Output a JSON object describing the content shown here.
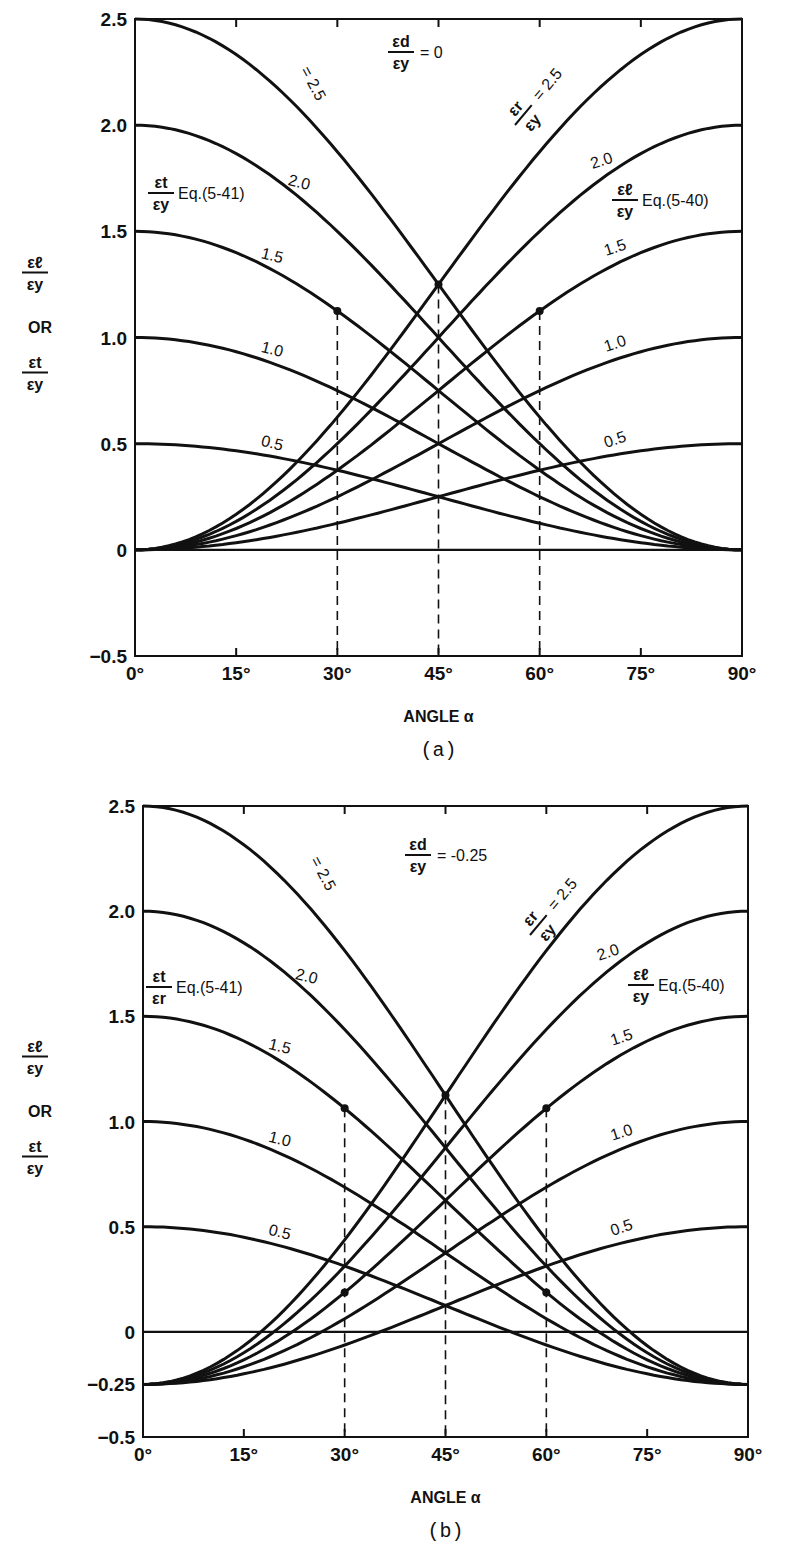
{
  "chart_data": [
    {
      "panel": "a",
      "type": "line",
      "caption": "(a)",
      "xlabel": "ANGLE α",
      "ylabel": [
        "εℓ/εy",
        "OR",
        "εt/εy"
      ],
      "x_ticks": [
        "0°",
        "15°",
        "30°",
        "45°",
        "60°",
        "75°",
        "90°"
      ],
      "y_ticks": [
        "2.5",
        "2.0",
        "1.5",
        "1.0",
        "0.5",
        "0",
        "-0.5"
      ],
      "xlim": [
        0,
        90
      ],
      "ylim": [
        -0.5,
        2.5
      ],
      "eps_d_over_eps_y": 0,
      "parameter_label": "εd/εy = 0",
      "curve_family_label": "εr/εy = 2.5",
      "eps_r_values": [
        0.5,
        1.0,
        1.5,
        2.0,
        2.5
      ],
      "curve_labels": [
        "0.5",
        "1.0",
        "1.5",
        "2.0"
      ],
      "eq_labels": {
        "et": "εt/εy Eq.(5-41)",
        "el": "εℓ/εy Eq.(5-40)"
      },
      "dashed_verticals": [
        30,
        45,
        60
      ],
      "marked_points": [
        {
          "x": 30,
          "y": 1.125
        },
        {
          "x": 60,
          "y": 1.125
        },
        {
          "x": 45,
          "y": 1.25
        }
      ],
      "series": [
        {
          "name": "εℓ/εy, εr/εy=0.5",
          "x": [
            0,
            15,
            30,
            45,
            60,
            75,
            90
          ],
          "values": [
            0,
            0.033,
            0.125,
            0.25,
            0.375,
            0.467,
            0.5
          ]
        },
        {
          "name": "εℓ/εy, εr/εy=1.0",
          "x": [
            0,
            15,
            30,
            45,
            60,
            75,
            90
          ],
          "values": [
            0,
            0.067,
            0.25,
            0.5,
            0.75,
            0.933,
            1.0
          ]
        },
        {
          "name": "εℓ/εy, εr/εy=1.5",
          "x": [
            0,
            15,
            30,
            45,
            60,
            75,
            90
          ],
          "values": [
            0,
            0.1,
            0.375,
            0.75,
            1.125,
            1.4,
            1.5
          ]
        },
        {
          "name": "εℓ/εy, εr/εy=2.0",
          "x": [
            0,
            15,
            30,
            45,
            60,
            75,
            90
          ],
          "values": [
            0,
            0.134,
            0.5,
            1.0,
            1.5,
            1.866,
            2.0
          ]
        },
        {
          "name": "εℓ/εy, εr/εy=2.5",
          "x": [
            0,
            15,
            30,
            45,
            60,
            75,
            90
          ],
          "values": [
            0,
            0.167,
            0.625,
            1.25,
            1.875,
            2.333,
            2.5
          ]
        },
        {
          "name": "εt/εy, εr/εy=0.5",
          "x": [
            0,
            15,
            30,
            45,
            60,
            75,
            90
          ],
          "values": [
            0.5,
            0.467,
            0.375,
            0.25,
            0.125,
            0.033,
            0
          ]
        },
        {
          "name": "εt/εy, εr/εy=1.0",
          "x": [
            0,
            15,
            30,
            45,
            60,
            75,
            90
          ],
          "values": [
            1.0,
            0.933,
            0.75,
            0.5,
            0.25,
            0.067,
            0
          ]
        },
        {
          "name": "εt/εy, εr/εy=1.5",
          "x": [
            0,
            15,
            30,
            45,
            60,
            75,
            90
          ],
          "values": [
            1.5,
            1.4,
            1.125,
            0.75,
            0.375,
            0.1,
            0
          ]
        },
        {
          "name": "εt/εy, εr/εy=2.0",
          "x": [
            0,
            15,
            30,
            45,
            60,
            75,
            90
          ],
          "values": [
            2.0,
            1.866,
            1.5,
            1.0,
            0.5,
            0.134,
            0
          ]
        },
        {
          "name": "εt/εy, εr/εy=2.5",
          "x": [
            0,
            15,
            30,
            45,
            60,
            75,
            90
          ],
          "values": [
            2.5,
            2.333,
            1.875,
            1.25,
            0.625,
            0.167,
            0
          ]
        }
      ],
      "grid": false,
      "legend": "inline labels"
    },
    {
      "panel": "b",
      "type": "line",
      "caption": "(b)",
      "xlabel": "ANGLE α",
      "ylabel": [
        "εℓ/εy",
        "OR",
        "εt/εy"
      ],
      "x_ticks": [
        "0°",
        "15°",
        "30°",
        "45°",
        "60°",
        "75°",
        "90°"
      ],
      "y_ticks": [
        "2.5",
        "2.0",
        "1.5",
        "1.0",
        "0.5",
        "0",
        "-0.25",
        "-0.5"
      ],
      "xlim": [
        0,
        90
      ],
      "ylim": [
        -0.5,
        2.5
      ],
      "eps_d_over_eps_y": -0.25,
      "parameter_label": "εd/εy = -0.25",
      "curve_family_label": "εr/εy = 2.5",
      "eps_r_values": [
        0.5,
        1.0,
        1.5,
        2.0,
        2.5
      ],
      "curve_labels": [
        "0.5",
        "1.0",
        "1.5",
        "2.0"
      ],
      "eq_labels": {
        "et": "εt/εr Eq.(5-41)",
        "el": "εℓ/εy Eq.(5-40)"
      },
      "dashed_verticals": [
        30,
        45,
        60
      ],
      "marked_points": [
        {
          "x": 30,
          "y": 1.0625
        },
        {
          "x": 60,
          "y": 1.0625
        },
        {
          "x": 30,
          "y": 0.1875
        },
        {
          "x": 60,
          "y": 0.1875
        },
        {
          "x": 45,
          "y": 1.125
        }
      ],
      "series": [
        {
          "name": "εℓ/εy, εr/εy=0.5",
          "x": [
            0,
            15,
            30,
            45,
            60,
            75,
            90
          ],
          "values": [
            -0.25,
            -0.2,
            -0.063,
            0.125,
            0.313,
            0.45,
            0.5
          ]
        },
        {
          "name": "εℓ/εy, εr/εy=1.0",
          "x": [
            0,
            15,
            30,
            45,
            60,
            75,
            90
          ],
          "values": [
            -0.25,
            -0.166,
            0.063,
            0.375,
            0.688,
            0.916,
            1.0
          ]
        },
        {
          "name": "εℓ/εy, εr/εy=1.5",
          "x": [
            0,
            15,
            30,
            45,
            60,
            75,
            90
          ],
          "values": [
            -0.25,
            -0.133,
            0.188,
            0.625,
            1.063,
            1.383,
            1.5
          ]
        },
        {
          "name": "εℓ/εy, εr/εy=2.0",
          "x": [
            0,
            15,
            30,
            45,
            60,
            75,
            90
          ],
          "values": [
            -0.25,
            -0.099,
            0.313,
            0.875,
            1.438,
            1.849,
            2.0
          ]
        },
        {
          "name": "εℓ/εy, εr/εy=2.5",
          "x": [
            0,
            15,
            30,
            45,
            60,
            75,
            90
          ],
          "values": [
            -0.25,
            -0.066,
            0.438,
            1.125,
            1.813,
            2.316,
            2.5
          ]
        },
        {
          "name": "εt/εy, εr/εy=0.5",
          "x": [
            0,
            15,
            30,
            45,
            60,
            75,
            90
          ],
          "values": [
            0.5,
            0.45,
            0.313,
            0.125,
            -0.063,
            -0.2,
            -0.25
          ]
        },
        {
          "name": "εt/εy, εr/εy=1.0",
          "x": [
            0,
            15,
            30,
            45,
            60,
            75,
            90
          ],
          "values": [
            1.0,
            0.916,
            0.688,
            0.375,
            0.063,
            -0.166,
            -0.25
          ]
        },
        {
          "name": "εt/εy, εr/εy=1.5",
          "x": [
            0,
            15,
            30,
            45,
            60,
            75,
            90
          ],
          "values": [
            1.5,
            1.383,
            1.063,
            0.625,
            0.188,
            -0.133,
            -0.25
          ]
        },
        {
          "name": "εt/εy, εr/εy=2.0",
          "x": [
            0,
            15,
            30,
            45,
            60,
            75,
            90
          ],
          "values": [
            2.0,
            1.849,
            1.438,
            0.875,
            0.313,
            -0.099,
            -0.25
          ]
        },
        {
          "name": "εt/εy, εr/εy=2.5",
          "x": [
            0,
            15,
            30,
            45,
            60,
            75,
            90
          ],
          "values": [
            2.5,
            2.316,
            1.813,
            1.125,
            0.438,
            -0.066,
            -0.25
          ]
        }
      ],
      "grid": false,
      "legend": "inline labels"
    }
  ],
  "panels": [
    {
      "frame": {
        "x0": 135,
        "x1": 742,
        "y0": 19,
        "y1": 656
      },
      "y_axis": [
        "εℓ",
        "εy",
        "OR",
        "εt",
        "εy"
      ],
      "param": {
        "num": "εd",
        "den": "εy",
        "eq": "= 0"
      },
      "family": {
        "num": "εr",
        "den": "εy",
        "eq": "= 2.5"
      },
      "et_eq": {
        "num": "εt",
        "den": "εy",
        "eq": "Eq.(5-41)"
      },
      "el_eq": {
        "num": "εℓ",
        "den": "εy",
        "eq": "Eq.(5-40)"
      },
      "xlabel": "ANGLE α",
      "caption": "(a)"
    },
    {
      "frame": {
        "x0": 143,
        "x1": 748,
        "y0": 806,
        "y1": 1437
      },
      "y_axis": [
        "εℓ",
        "εy",
        "OR",
        "εt",
        "εy"
      ],
      "param": {
        "num": "εd",
        "den": "εy",
        "eq": "= -0.25"
      },
      "family": {
        "num": "εr",
        "den": "εy",
        "eq": "= 2.5"
      },
      "et_eq": {
        "num": "εt",
        "den": "εr",
        "eq": "Eq.(5-41)"
      },
      "el_eq": {
        "num": "εℓ",
        "den": "εy",
        "eq": "Eq.(5-40)"
      },
      "xlabel": "ANGLE α",
      "caption": "(b)"
    }
  ]
}
